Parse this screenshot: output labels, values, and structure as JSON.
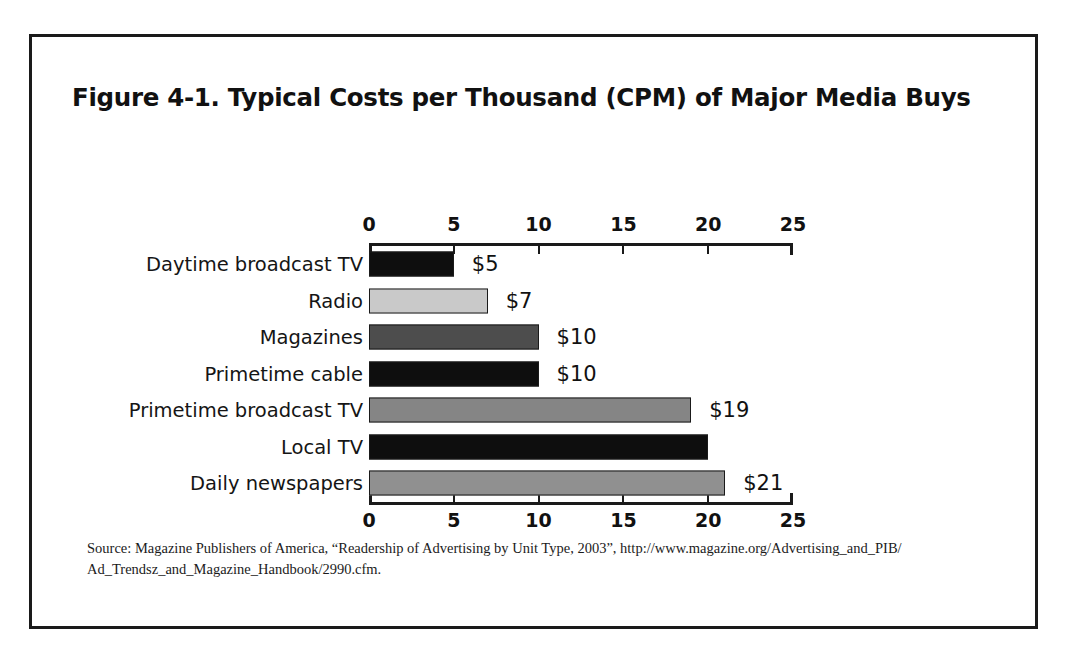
{
  "figure": {
    "title": "Figure 4-1. Typical Costs per Thousand (CPM) of Major Media Buys",
    "source_line1": "Source: Magazine Publishers of America, “Readership of Advertising by Unit Type, 2003”, http://www.magazine.org/Advertising_and_PIB/",
    "source_line2": "Ad_Trendsz_and_Magazine_Handbook/2990.cfm."
  },
  "chart_data": {
    "type": "bar",
    "orientation": "horizontal",
    "title": "Figure 4-1. Typical Costs per Thousand (CPM) of Major Media Buys",
    "xlabel": "",
    "ylabel": "",
    "xlim": [
      0,
      25
    ],
    "grid": false,
    "legend": "none",
    "axis_position": "both-top-and-bottom",
    "tick_labels": [
      "0",
      "5",
      "10",
      "15",
      "20",
      "25"
    ],
    "ticks": [
      0,
      5,
      10,
      15,
      20,
      25
    ],
    "categories": [
      "Daytime broadcast TV",
      "Radio",
      "Magazines",
      "Primetime cable",
      "Primetime broadcast TV",
      "Local TV",
      "Daily newspapers"
    ],
    "values": [
      5,
      7,
      10,
      10,
      19,
      20,
      21
    ],
    "data_labels": [
      "$5",
      "$7",
      "$10",
      "$10",
      "$19",
      "",
      "$21"
    ],
    "bar_colors": [
      "#0e0e0e",
      "#c9c9c9",
      "#4d4d4d",
      "#0e0e0e",
      "#858585",
      "#0e0e0e",
      "#909090"
    ]
  }
}
